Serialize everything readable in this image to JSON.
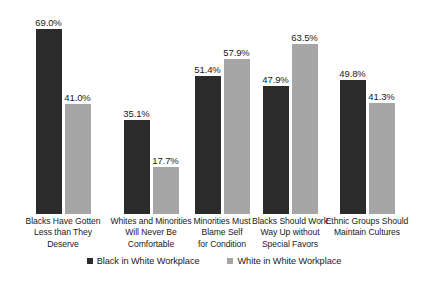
{
  "chart_data": {
    "type": "bar",
    "title": "",
    "subtitle": "",
    "xlabel": "",
    "ylabel": "",
    "ylim": [
      0,
      80
    ],
    "grid": false,
    "legend_position": "bottom",
    "value_suffix": "%",
    "categories": [
      "Blacks Have Gotten Less than They Deserve",
      "Whites and Minorities Will Never Be Comfortable",
      "Minorities Must Blame Self for Condition",
      "Blacks Should Work Way Up without Special Favors",
      "Ethnic Groups Should Maintain Cultures"
    ],
    "category_lines": [
      [
        "Blacks Have Gotten",
        "Less than They",
        "Deserve"
      ],
      [
        "Whites and Minorities",
        "Will Never Be",
        "Comfortable"
      ],
      [
        "Minorities Must",
        "Blame Self",
        "for Condition"
      ],
      [
        "Blacks Should Work",
        "Way Up without",
        "Special Favors"
      ],
      [
        "Ethnic Groups Should",
        "Maintain Cultures"
      ]
    ],
    "series": [
      {
        "name": "Black in White Workplace",
        "color": "#2b2b2b",
        "values": [
          69.0,
          35.1,
          51.4,
          47.9,
          49.8
        ],
        "labels": [
          "69.0%",
          "35.1%",
          "51.4%",
          "47.9%",
          "49.8%"
        ]
      },
      {
        "name": "White in White Workplace",
        "color": "#a6a6a6",
        "values": [
          41.0,
          17.7,
          57.9,
          63.5,
          41.3
        ],
        "labels": [
          "41.0%",
          "17.7%",
          "57.9%",
          "63.5%",
          "41.3%"
        ]
      }
    ]
  },
  "legend": {
    "items": [
      {
        "label": "Black in White Workplace",
        "color": "#2b2b2b"
      },
      {
        "label": "White in White Workplace",
        "color": "#a6a6a6"
      }
    ]
  },
  "colors": {
    "series_black": "#2b2b2b",
    "series_white": "#a6a6a6",
    "background": "#ffffff",
    "text": "#1a1a1a"
  }
}
